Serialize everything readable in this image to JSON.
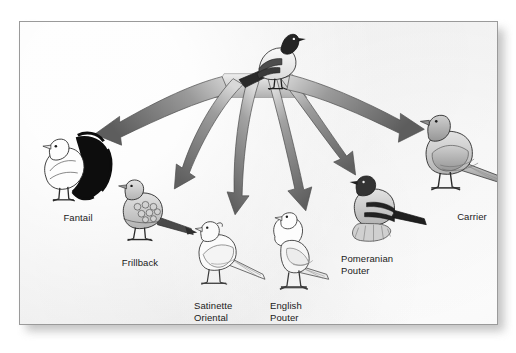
{
  "figure": {
    "kind": "radiating-arrow-diagram",
    "frame": {
      "background_color": "#f2f2f2",
      "border_color": "#9a9a9a",
      "shadow_color": "#b9b9b9"
    },
    "arrow": {
      "color_dark": "#5f5f5f",
      "color_light": "#cfcfcf",
      "count": 6
    }
  },
  "ancestor": {
    "name": "rock-pigeon-ancestor",
    "label": "",
    "plumage": "dark head and tail, pale gray body with two dark wing bars",
    "position": {
      "x": 258,
      "y": 60
    }
  },
  "breeds": [
    {
      "id": "fantail",
      "label": "Fantail",
      "label_lines": [
        "Fantail"
      ],
      "label_align": "center",
      "label_x": 56,
      "label_y": 196,
      "bird_x": 30,
      "bird_y": 132,
      "plumage": "white body with large black fanned tail",
      "arrow_index": 0
    },
    {
      "id": "frillback",
      "label": "Frillback",
      "label_lines": [
        "Frillback"
      ],
      "label_align": "center",
      "label_x": 117,
      "label_y": 241,
      "bird_x": 101,
      "bird_y": 178,
      "plumage": "gray with curled frilled wing feathers",
      "arrow_index": 1
    },
    {
      "id": "satinette-oriental-frill",
      "label": "Satinette Oriental Frill",
      "label_lines": [
        "Satinette",
        "Oriental",
        "Frill"
      ],
      "label_align": "left",
      "label_x": 193,
      "label_y": 286,
      "bird_x": 181,
      "bird_y": 222,
      "plumage": "white outline, short beak, small crest",
      "arrow_index": 2
    },
    {
      "id": "english-pouter",
      "label": "English Pouter",
      "label_lines": [
        "English",
        "Pouter"
      ],
      "label_align": "left",
      "label_x": 269,
      "label_y": 286,
      "bird_x": 255,
      "bird_y": 218,
      "plumage": "white with inflated crop, upright stance",
      "arrow_index": 3
    },
    {
      "id": "pomeranian-pouter",
      "label": "Pomeranian Pouter",
      "label_lines": [
        "Pomeranian",
        "Pouter"
      ],
      "label_align": "left",
      "label_x": 340,
      "label_y": 239,
      "bird_x": 337,
      "bird_y": 178,
      "plumage": "gray with dark head, black wing bars, feathered feet",
      "arrow_index": 4
    },
    {
      "id": "carrier",
      "label": "Carrier",
      "label_lines": [
        "Carrier"
      ],
      "label_align": "center",
      "label_x": 452,
      "label_y": 195,
      "bird_x": 416,
      "bird_y": 120,
      "plumage": "uniform gray, long body and tail",
      "arrow_index": 5
    }
  ]
}
